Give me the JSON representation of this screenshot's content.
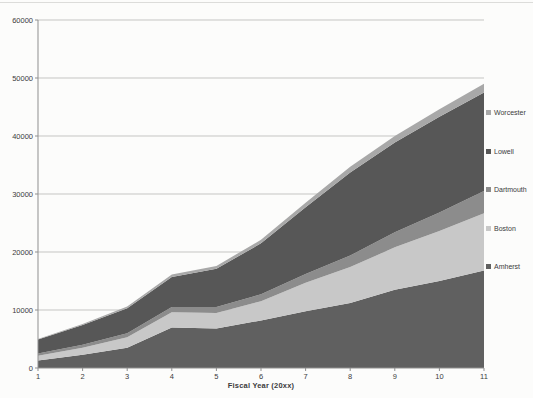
{
  "figure": {
    "kind": "scanned grayscale stacked area chart",
    "background": "#fcfcfb"
  },
  "chart_data": {
    "type": "area",
    "stacked": true,
    "title": "",
    "xlabel": "Fiscal Year (20xx)",
    "ylabel": "",
    "x": [
      1,
      2,
      3,
      4,
      5,
      6,
      7,
      8,
      9,
      10,
      11
    ],
    "x_tick_labels": [
      "1",
      "2",
      "3",
      "4",
      "5",
      "6",
      "7",
      "8",
      "9",
      "10",
      "11"
    ],
    "y_ticks": [
      0,
      10000,
      20000,
      30000,
      40000,
      50000,
      60000
    ],
    "y_tick_labels": [
      "0",
      "10000",
      "20000",
      "30000",
      "40000",
      "50000",
      "60000"
    ],
    "xlim": [
      1,
      11
    ],
    "ylim": [
      0,
      60000
    ],
    "grid": "horizontal",
    "legend_position": "right",
    "series": [
      {
        "name": "Amherst",
        "color": "#606060",
        "values": [
          1300,
          2300,
          3500,
          7000,
          6800,
          8200,
          9800,
          11200,
          13500,
          15000,
          16800
        ]
      },
      {
        "name": "Boston",
        "color": "#c8c8c8",
        "values": [
          800,
          1200,
          1800,
          2600,
          2700,
          3300,
          4900,
          6200,
          7300,
          8600,
          9900
        ]
      },
      {
        "name": "Dartmouth",
        "color": "#8c8c8c",
        "values": [
          400,
          500,
          700,
          900,
          1000,
          1200,
          1500,
          2000,
          2600,
          3200,
          3800
        ]
      },
      {
        "name": "Lowell",
        "color": "#575757",
        "values": [
          2400,
          3400,
          4300,
          5200,
          6600,
          8800,
          11500,
          14300,
          15500,
          16500,
          17000
        ]
      },
      {
        "name": "Worcester",
        "color": "#a8a8a8",
        "values": [
          100,
          200,
          300,
          400,
          500,
          600,
          800,
          1000,
          1100,
          1300,
          1500
        ]
      }
    ],
    "legend_order_top_to_bottom": [
      "Worcester",
      "Lowell",
      "Dartmouth",
      "Boston",
      "Amherst"
    ]
  },
  "style": {
    "gridline_color": "#c5c5c3",
    "axis_line_color": "#8f8f8f",
    "tick_color": "#8f8f8f",
    "text_color": "#3b3b3b"
  }
}
